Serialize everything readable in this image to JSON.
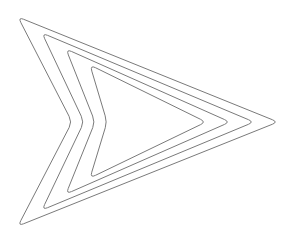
{
  "canvas": {
    "width": 299,
    "height": 243,
    "background_color": "#ffffff",
    "title": "Nested Chevron Outline"
  },
  "figure": {
    "name": "nested-chevron-arrow",
    "ring_count": 4,
    "stroke_color": "#7a7a7a",
    "stroke_width": 1,
    "fill": "none",
    "corner_radius": 6
  },
  "chart_data": {
    "type": "line",
    "xlabel": "",
    "ylabel": "",
    "xlim": [
      0,
      299
    ],
    "ylim": [
      0,
      243
    ],
    "grid": false,
    "legend": "none",
    "series": [
      {
        "name": "ring-1-outer",
        "closed": true,
        "points": [
          [
            18,
            17
          ],
          [
            278,
            122
          ],
          [
            18,
            226
          ],
          [
            72,
            122
          ]
        ]
      },
      {
        "name": "ring-2",
        "closed": true,
        "points": [
          [
            42,
            33
          ],
          [
            254,
            122
          ],
          [
            42,
            210
          ],
          [
            84,
            122
          ]
        ]
      },
      {
        "name": "ring-3",
        "closed": true,
        "points": [
          [
            66,
            49
          ],
          [
            230,
            122
          ],
          [
            66,
            194
          ],
          [
            95,
            122
          ]
        ]
      },
      {
        "name": "ring-4-inner",
        "closed": true,
        "points": [
          [
            90,
            65
          ],
          [
            206,
            122
          ],
          [
            90,
            178
          ],
          [
            107,
            122
          ]
        ]
      }
    ]
  }
}
